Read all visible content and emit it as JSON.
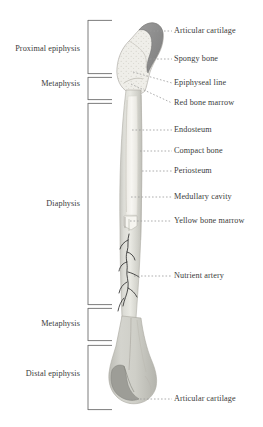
{
  "diagram": {
    "background_color": "#ffffff",
    "text_color": "#3b3b3b",
    "leader_line_color": "#9a9a9a",
    "bracket_color": "#6e6e6e"
  },
  "colors": {
    "compact_bone": "#d8d8d2",
    "compact_bone_dark": "#bdbdb6",
    "spongy_bone": "#ecebe6",
    "articular_cartilage": "#8f8f8f",
    "medullary_cavity": "#f4f3ef",
    "yellow_marrow": "#efefe6",
    "distal_epiphysis": "#c9c9c3",
    "nutrient_artery": "#2e2e2e",
    "outline": "#a8a8a2"
  },
  "left_labels": [
    {
      "id": "proximal-epiphysis",
      "text": "Proximal epiphysis",
      "x": 74,
      "y": 48
    },
    {
      "id": "metaphysis-proximal",
      "text": "Metaphysis",
      "x": 74,
      "y": 83
    },
    {
      "id": "diaphysis",
      "text": "Diaphysis",
      "x": 74,
      "y": 207
    },
    {
      "id": "metaphysis-distal",
      "text": "Metaphysis",
      "x": 74,
      "y": 322
    },
    {
      "id": "distal-epiphysis",
      "text": "Distal epiphysis",
      "x": 74,
      "y": 372
    }
  ],
  "right_labels": [
    {
      "id": "articular-cartilage-proximal",
      "text": "Articular cartilage",
      "x": 175,
      "y": 28,
      "leader_from_x": 148,
      "leader_to_x": 172,
      "leader_y": 31,
      "anchor_x": 148,
      "anchor_y": 31
    },
    {
      "id": "spongy-bone",
      "text": "Spongy bone",
      "x": 175,
      "y": 56,
      "leader_from_x": 148,
      "leader_to_x": 172,
      "leader_y": 59,
      "anchor_x": 148,
      "anchor_y": 59
    },
    {
      "id": "epiphyseal-line",
      "text": "Epiphyseal line",
      "x": 175,
      "y": 80,
      "leader_from_x": 140,
      "leader_to_x": 172,
      "leader_y": 83,
      "anchor_x": 133,
      "anchor_y": 72
    },
    {
      "id": "red-bone-marrow",
      "text": "Red bone marrow",
      "x": 175,
      "y": 100,
      "leader_from_x": 140,
      "leader_to_x": 172,
      "leader_y": 103,
      "anchor_x": 131,
      "anchor_y": 83
    },
    {
      "id": "endosteum",
      "text": "Endosteum",
      "x": 175,
      "y": 127,
      "leader_from_x": 132,
      "leader_to_x": 172,
      "leader_y": 130,
      "anchor_x": 132,
      "anchor_y": 130
    },
    {
      "id": "compact-bone",
      "text": "Compact bone",
      "x": 175,
      "y": 148,
      "leader_from_x": 136,
      "leader_to_x": 172,
      "leader_y": 151,
      "anchor_x": 136,
      "anchor_y": 151
    },
    {
      "id": "periosteum",
      "text": "Periosteum",
      "x": 175,
      "y": 168,
      "leader_from_x": 138,
      "leader_to_x": 172,
      "leader_y": 171,
      "anchor_x": 138,
      "anchor_y": 171
    },
    {
      "id": "medullary-cavity",
      "text": "Medullary cavity",
      "x": 175,
      "y": 194,
      "leader_from_x": 130,
      "leader_to_x": 172,
      "leader_y": 197,
      "anchor_x": 130,
      "anchor_y": 197
    },
    {
      "id": "yellow-bone-marrow",
      "text": "Yellow bone marrow",
      "x": 175,
      "y": 218,
      "leader_from_x": 129,
      "leader_to_x": 172,
      "leader_y": 221,
      "anchor_x": 129,
      "anchor_y": 221
    },
    {
      "id": "nutrient-artery",
      "text": "Nutrient artery",
      "x": 175,
      "y": 273,
      "leader_from_x": 134,
      "leader_to_x": 172,
      "leader_y": 276,
      "anchor_x": 134,
      "anchor_y": 276
    },
    {
      "id": "articular-cartilage-distal",
      "text": "Articular cartilage",
      "x": 175,
      "y": 396,
      "leader_from_x": 126,
      "leader_to_x": 172,
      "leader_y": 399,
      "anchor_x": 126,
      "anchor_y": 399
    }
  ],
  "brackets": [
    {
      "id": "bracket-proximal-epiphysis",
      "label_ref": "Proximal epiphysis",
      "x": 88,
      "top": 20,
      "bottom": 74,
      "tick_length": 24
    },
    {
      "id": "bracket-metaphysis-proximal",
      "label_ref": "Metaphysis",
      "x": 88,
      "top": 77,
      "bottom": 100,
      "tick_length": 24
    },
    {
      "id": "bracket-diaphysis",
      "label_ref": "Diaphysis",
      "x": 88,
      "top": 103,
      "bottom": 305,
      "tick_length": 24
    },
    {
      "id": "bracket-metaphysis-distal",
      "label_ref": "Metaphysis",
      "x": 88,
      "top": 308,
      "bottom": 341,
      "tick_length": 24
    },
    {
      "id": "bracket-distal-epiphysis",
      "label_ref": "Distal epiphysis",
      "x": 88,
      "top": 345,
      "bottom": 410,
      "tick_length": 24
    }
  ]
}
